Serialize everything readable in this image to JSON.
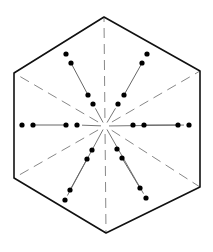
{
  "diagram": {
    "shape": "hexagon",
    "stroke_color": "#111111",
    "dash_color": "#888888",
    "dot_color": "#000000",
    "background": "#ffffff",
    "center": [
      105,
      126
    ],
    "vertices": [
      [
        104,
        17
      ],
      [
        200,
        71
      ],
      [
        200,
        187
      ],
      [
        106,
        233
      ],
      [
        14,
        178
      ],
      [
        14,
        73
      ]
    ],
    "dashed_spokes_to_vertices": true,
    "dashed_spokes_to_edge_midpoints_horizontal": true,
    "rays": [
      {
        "direction": "upper-left",
        "dots": [
          [
            66,
            54
          ],
          [
            71,
            63
          ],
          [
            88,
            95
          ],
          [
            93,
            104
          ]
        ]
      },
      {
        "direction": "upper-right",
        "dots": [
          [
            147,
            54
          ],
          [
            142,
            63
          ],
          [
            124,
            95
          ],
          [
            118,
            104
          ]
        ]
      },
      {
        "direction": "left",
        "dots": [
          [
            22,
            125
          ],
          [
            33,
            125
          ],
          [
            66,
            125
          ],
          [
            77,
            125
          ]
        ]
      },
      {
        "direction": "right",
        "dots": [
          [
            133,
            125
          ],
          [
            144,
            125
          ],
          [
            178,
            125
          ],
          [
            189,
            125
          ]
        ]
      },
      {
        "direction": "lower-left",
        "dots": [
          [
            92,
            150
          ],
          [
            87,
            159
          ],
          [
            70,
            190
          ],
          [
            65,
            200
          ]
        ]
      },
      {
        "direction": "lower-right",
        "dots": [
          [
            117,
            149
          ],
          [
            122,
            158
          ],
          [
            140,
            188
          ],
          [
            146,
            198
          ]
        ]
      }
    ]
  }
}
